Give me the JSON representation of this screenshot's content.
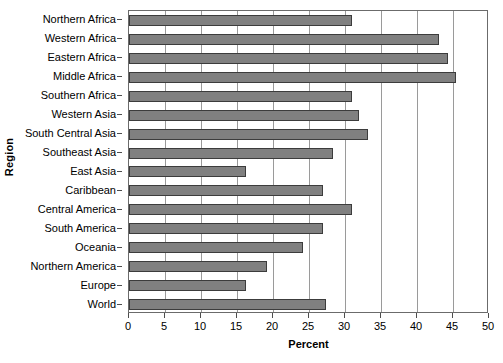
{
  "chart_data": {
    "type": "bar",
    "orientation": "horizontal",
    "title": "",
    "xlabel": "Percent",
    "ylabel": "Region",
    "xlim": [
      0,
      50
    ],
    "ylim": null,
    "grid": true,
    "legend": false,
    "xticks": [
      0,
      5,
      10,
      15,
      20,
      25,
      30,
      35,
      40,
      45,
      50
    ],
    "categories": [
      "Northern Africa",
      "Western Africa",
      "Eastern Africa",
      "Middle Africa",
      "Southern Africa",
      "Western Asia",
      "South Central Asia",
      "Southeast Asia",
      "East Asia",
      "Caribbean",
      "Central America",
      "South America",
      "Oceania",
      "Northern America",
      "Europe",
      "World"
    ],
    "values": [
      31,
      43,
      44.3,
      45.4,
      31,
      32,
      33.2,
      28.3,
      16.2,
      27,
      31,
      27,
      24.2,
      19.2,
      16.2,
      27.4
    ],
    "bar_color": "#808080",
    "bar_edge_color": "#3c3c3c",
    "grid_color": "#9a9a9a",
    "axis_color": "#6b6b6b"
  }
}
